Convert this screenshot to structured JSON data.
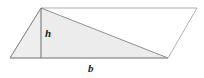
{
  "figure": {
    "kind": "geometry-diagram",
    "canvas": {
      "width": 204,
      "height": 78,
      "background": "#ffffff"
    },
    "colors": {
      "fill": "#ececec",
      "fill_secondary": "#eeeeee",
      "stroke": "#8f8f8f",
      "stroke_light": "#a8a8a8",
      "label": "#1a1a1a"
    },
    "vertices": {
      "top_left": {
        "x": 41,
        "y": 8
      },
      "top_right": {
        "x": 197,
        "y": 8
      },
      "bottom_right": {
        "x": 168,
        "y": 58
      },
      "bottom_left": {
        "x": 10,
        "y": 58
      }
    },
    "shapes": {
      "parallelogram": {
        "name": "parallelogram-outline",
        "points": "41,8 197,8 168,58 10,58",
        "fill": "none",
        "stroke": "#a8a8a8",
        "stroke_width": 0.9
      },
      "triangle": {
        "name": "shaded-triangle",
        "points": "41,8 168,58 10,58",
        "fill": "#ececec",
        "stroke": "#8f8f8f",
        "stroke_width": 1.0
      },
      "height_line": {
        "name": "height-segment",
        "x1": 41,
        "y1": 8,
        "x2": 41,
        "y2": 58,
        "stroke": "#6f6f6f",
        "stroke_width": 1.0
      }
    },
    "labels": {
      "height": "h",
      "base": "b"
    }
  }
}
